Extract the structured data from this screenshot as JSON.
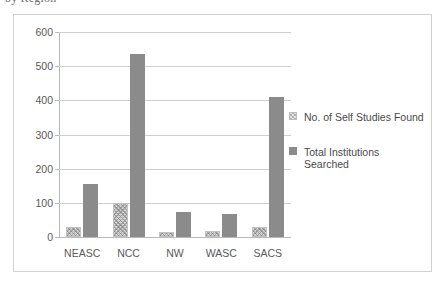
{
  "caption": {
    "text": "by Region"
  },
  "chart_data": {
    "type": "bar",
    "title": "",
    "subtitle": "",
    "xlabel": "",
    "ylabel": "",
    "categories": [
      "NEASC",
      "NCC",
      "NW",
      "WASC",
      "SACS"
    ],
    "series": [
      {
        "name": "No. of Self Studies Found",
        "values": [
          30,
          100,
          15,
          17,
          30
        ],
        "color": "#d8d8d8",
        "fill": "pattern-dither"
      },
      {
        "name": "Total Institutions Searched",
        "values": [
          155,
          535,
          73,
          67,
          410
        ],
        "color": "#8b8b8b",
        "fill": "solid"
      }
    ],
    "ylim": [
      0,
      600
    ],
    "yticks": [
      0,
      100,
      200,
      300,
      400,
      500,
      600
    ],
    "ytick_labels": [
      "0",
      "100",
      "200",
      "300",
      "400",
      "500",
      "600"
    ],
    "grid": true,
    "grid_axis": "y",
    "legend": true,
    "legend_position": "right",
    "legend_entries": [
      {
        "label": "No. of Self Studies Found",
        "label_line2": ""
      },
      {
        "label": "Total Institutions",
        "label_line2": "Searched"
      }
    ],
    "background": "#ffffff",
    "border_color": "#d2d2d2",
    "grid_color": "#cfcfcf",
    "axis_color": "#b9b9b9",
    "text_color": "#595959"
  }
}
